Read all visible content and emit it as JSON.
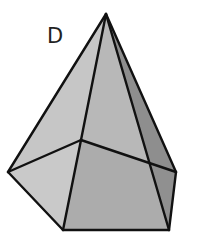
{
  "figure": {
    "label": "D",
    "shape": "pentagonal pyramid",
    "colors": {
      "background": "#ffffff",
      "edge": "#111111",
      "face_left": "#c8c8c8",
      "face_front": "#b4b4b4",
      "face_right_dark": "#8c8c8c",
      "face_base_left": "#c4c4c4",
      "face_base_front": "#aaaaaa",
      "face_base_right": "#909090"
    },
    "vertices": {
      "apex": [
        106,
        14
      ],
      "left": [
        8,
        172
      ],
      "back_center": [
        81,
        140
      ],
      "front_left_bottom": [
        63,
        230
      ],
      "front_right_bottom": [
        169,
        230
      ],
      "right": [
        176,
        172
      ]
    }
  }
}
